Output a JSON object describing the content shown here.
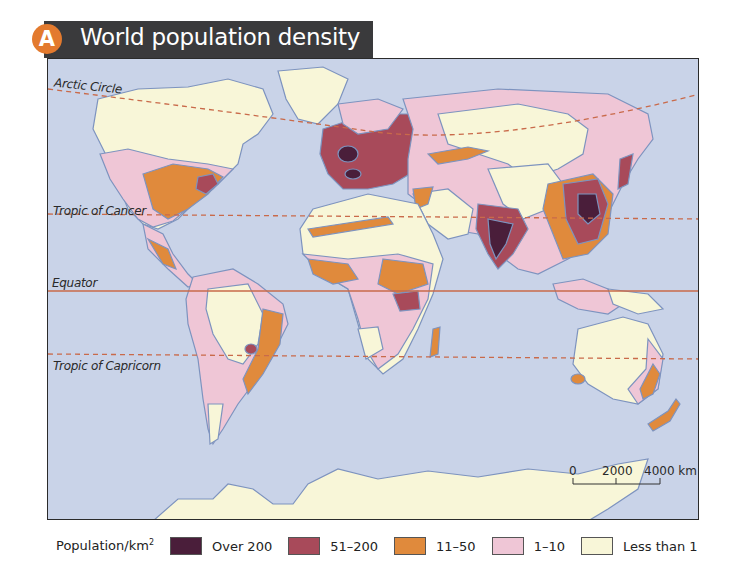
{
  "header": {
    "badge": "A",
    "title": "World population density"
  },
  "map": {
    "lines": {
      "arctic_circle": "Arctic Circle",
      "tropic_of_cancer": "Tropic of Cancer",
      "equator": "Equator",
      "tropic_of_capricorn": "Tropic of Capricorn"
    },
    "scale_bar": {
      "ticks": [
        "0",
        "2000",
        "4000 km"
      ]
    },
    "colors": {
      "ocean": "#c9d3e8",
      "over_200": "#4a1e3a",
      "51_200": "#a84a5a",
      "11_50": "#e08a3c",
      "1_10": "#efc6d6",
      "less_than_1": "#f8f6d8",
      "coastline": "#7d93bf",
      "latitude_line": "#c96a4a"
    }
  },
  "legend": {
    "title": "Population/km",
    "title_sup": "2",
    "items": [
      {
        "label": "Over 200",
        "color": "#4a1e3a"
      },
      {
        "label": "51–200",
        "color": "#a84a5a"
      },
      {
        "label": "11–50",
        "color": "#e08a3c"
      },
      {
        "label": "1–10",
        "color": "#efc6d6"
      },
      {
        "label": "Less than 1",
        "color": "#f8f6d8"
      }
    ]
  }
}
